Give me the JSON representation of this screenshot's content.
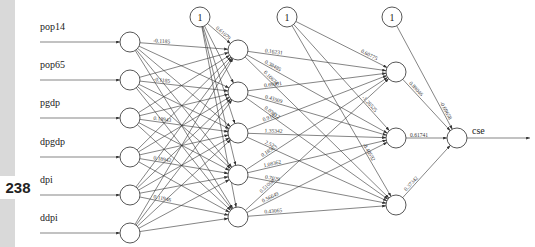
{
  "page": {
    "number": "238"
  },
  "diagram": {
    "type": "neural-network",
    "inputs": [
      "pop14",
      "pop65",
      "pgdp",
      "dpgdp",
      "dpi",
      "ddpi"
    ],
    "output": "cse",
    "bias_label": "1",
    "layers": {
      "input": 6,
      "hidden1": 5,
      "hidden2": 3,
      "output": 1
    },
    "weights": {
      "input_labels_visible": [
        "-0.1185",
        "0.18943",
        "0.18942",
        "0.11946",
        "0.48017",
        "1.18509",
        "-1.18414",
        "0.66502",
        "1.16510",
        "-1.35381",
        "0.45511",
        "-0.48017"
      ],
      "bias1_to_h1_top": "0.61079",
      "h1_to_h2": {
        "h1_1": [
          "0.16231",
          "0.38485",
          "0.10674"
        ],
        "h1_2": [
          "0.69091",
          "0.43509",
          "0.03612"
        ],
        "h1_3": [
          "0.9107",
          "1.35342",
          "2.52"
        ],
        "h1_4": [
          "0.18563",
          "1.08362",
          "0.7029"
        ],
        "h1_5": [
          "0.51008",
          "0.56649",
          "0.43065"
        ]
      },
      "h1_vertical": [
        "-1.33508",
        "-0.79406"
      ],
      "bias2_to_h2": [
        "0.60775",
        "-1.26525",
        "-0.40592"
      ],
      "h2_to_out": [
        "0.89046",
        "0.61741",
        "0.37342"
      ],
      "bias3_to_out": "-0.69658"
    }
  }
}
